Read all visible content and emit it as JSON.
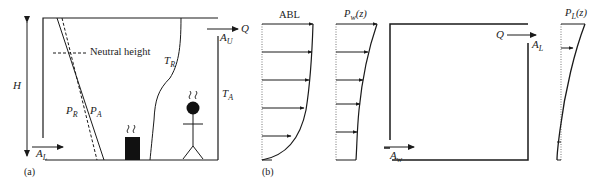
{
  "panel_a": {
    "label": "(a)",
    "height_label": "H",
    "neutral_height_label": "Neutral height",
    "pressure_room": {
      "main": "P",
      "sub": "R"
    },
    "pressure_ambient": {
      "main": "P",
      "sub": "A"
    },
    "temp_room": {
      "main": "T",
      "sub": "R"
    },
    "temp_ambient": {
      "main": "T",
      "sub": "A"
    },
    "lower_opening": {
      "main": "A",
      "sub": "L"
    },
    "upper_opening": {
      "main": "A",
      "sub": "U"
    },
    "flow": "Q",
    "icons": [
      "heat-source-icon",
      "person-icon"
    ]
  },
  "panel_b": {
    "label": "(b)",
    "abl_title": "ABL",
    "wind_pressure_title": {
      "main": "P",
      "sub": "w",
      "arg": "(z)"
    },
    "leeward_pressure_title": {
      "main": "P",
      "sub": "L",
      "arg": "(z)"
    },
    "windward_opening": {
      "main": "A",
      "sub": "w"
    },
    "leeward_opening": {
      "main": "A",
      "sub": "L"
    },
    "flow": "Q"
  },
  "colors": {
    "line": "#1a1a1a",
    "dotted": "#777777"
  }
}
